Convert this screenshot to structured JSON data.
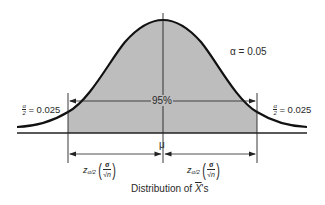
{
  "diagram": {
    "caption_prefix": "Distribution of ",
    "caption_var": "X",
    "caption_suffix": "'s",
    "alpha_label": "α = 0.05",
    "center_label": "95%",
    "mean_label": "μ",
    "left_tail": {
      "frac_num": "α",
      "frac_den": "2",
      "value": "= 0.025"
    },
    "right_tail": {
      "frac_num": "α",
      "frac_den": "2",
      "value": "= 0.025"
    },
    "left_margin": {
      "z": "z",
      "sub": "α/2",
      "num": "σ",
      "den": "√n"
    },
    "right_margin": {
      "z": "z",
      "sub": "α/2",
      "num": "σ",
      "den": "√n"
    },
    "colors": {
      "shade": "#bdbdbd",
      "curve": "#111111",
      "lines": "#222222",
      "background": "#ffffff"
    }
  }
}
